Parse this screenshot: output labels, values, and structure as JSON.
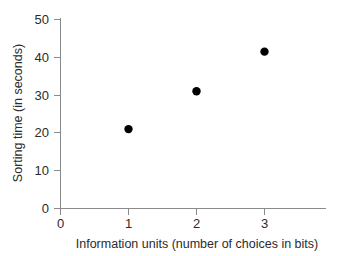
{
  "chart_data": {
    "type": "scatter",
    "title": "",
    "xlabel": "Information units (number of choices in bits)",
    "ylabel": "Sorting time (in seconds)",
    "x": [
      1,
      2,
      3
    ],
    "values": [
      21,
      31,
      41.5
    ],
    "series": [
      {
        "name": "Sorting time",
        "x": [
          1,
          2,
          3
        ],
        "values": [
          21,
          31,
          41.5
        ],
        "color": "#000000",
        "marker": "filled-circle"
      }
    ],
    "xlim": [
      0,
      3.9
    ],
    "ylim": [
      0,
      50
    ],
    "xticks": [
      "0",
      "1",
      "2",
      "3"
    ],
    "xtick_values": [
      0,
      1,
      2,
      3
    ],
    "yticks": [
      "0",
      "10",
      "20",
      "30",
      "40",
      "50"
    ],
    "ytick_values": [
      0,
      10,
      20,
      30,
      40,
      50
    ],
    "grid": false,
    "legend": false,
    "legend_position": "none",
    "axis_color": "#8a8a8a",
    "text_color": "#2b2b2b",
    "background": "#ffffff"
  }
}
